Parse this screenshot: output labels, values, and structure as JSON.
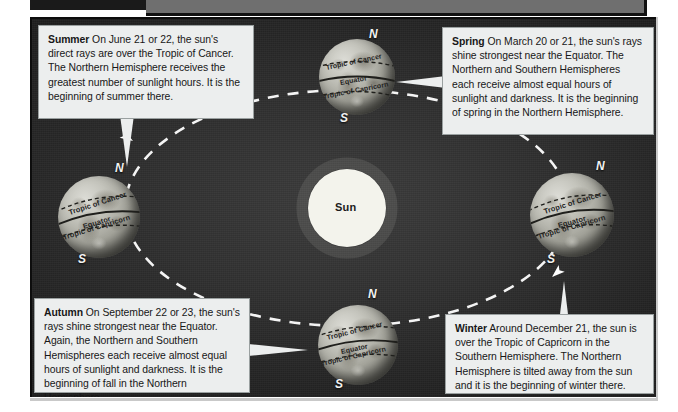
{
  "figure": {
    "background_color": "#2b2b2b",
    "box_background_color": "#eceeee",
    "orbit_color": "#ffffff",
    "sun_color": "#f4f4ee"
  },
  "sun": {
    "label": "Sun"
  },
  "callouts": [
    {
      "id": "summer",
      "season": "Summer",
      "text": " On June 21 or 22, the sun's direct rays are over the Tropic of Cancer. The Northern Hemisphere receives the greatest number of sunlight hours. It is the beginning of summer there."
    },
    {
      "id": "spring",
      "season": "Spring",
      "text": " On March 20 or 21, the sun's rays shine strongest near the Equator. The Northern and Southern Hemispheres each receive almost equal hours of sunlight and darkness. It is the beginning of spring in the Northern Hemisphere."
    },
    {
      "id": "autumn",
      "season": "Autumn",
      "text": " On September 22 or 23, the sun's rays shine strongest near the Equator. Again, the Northern and Southern Hemispheres each receive almost equal hours of sunlight and darkness. It is the beginning of fall in the Northern Hemisphere."
    },
    {
      "id": "winter",
      "season": "Winter",
      "text": " Around December 21, the sun is over the Tropic of Capricorn in the Southern Hemisphere. The Northern Hemisphere is tilted away from the sun and it is the beginning of winter there."
    }
  ],
  "globes": [
    {
      "id": "globe-spring",
      "position": "top",
      "north_label": "N",
      "south_label": "S",
      "bands": [
        "Tropic of Cancer",
        "Equator",
        "Tropic of Capricorn"
      ]
    },
    {
      "id": "globe-summer",
      "position": "left",
      "north_label": "N",
      "south_label": "S",
      "bands": [
        "Tropic of Cancer",
        "Equator",
        "Tropic of Capricorn"
      ]
    },
    {
      "id": "globe-winter",
      "position": "right",
      "north_label": "N",
      "south_label": "S",
      "bands": [
        "Tropic of Cancer",
        "Equator",
        "Tropic of Capricorn"
      ]
    },
    {
      "id": "globe-autumn",
      "position": "bottom",
      "north_label": "N",
      "south_label": "S",
      "bands": [
        "Tropic of Cancer",
        "Equator",
        "Tropic of Capricorn"
      ]
    }
  ]
}
